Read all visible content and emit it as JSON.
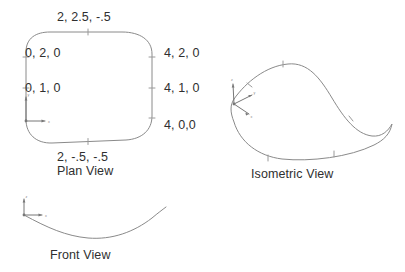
{
  "document": {
    "title": "Surface Patch Orthographic and Isometric Views",
    "background_color": "#ffffff",
    "line_color": "#8a8a8a",
    "text_color": "#2f2f2f"
  },
  "plan_view": {
    "title": "Plan View",
    "shape_name": "rounded-patch-outline",
    "labels": {
      "top": "2, 2.5, -.5",
      "left_upper": "0, 2, 0",
      "left_lower": "0, 1, 0",
      "right_upper": "4, 2, 0",
      "right_middle": "4, 1, 0",
      "right_lower": "4, 0,0",
      "bottom": "2, -.5, -.5"
    },
    "axis": {
      "x_label": "x",
      "y_label": "y"
    }
  },
  "isometric_view": {
    "title": "Isometric View",
    "shape_name": "saddle-patch-outline",
    "axis": {
      "x_label": "x",
      "y_label": "y",
      "z_label": "z"
    }
  },
  "front_view": {
    "title": "Front View",
    "shape_name": "sagging-curve",
    "axis": {
      "x_label": "x",
      "z_label": "z"
    }
  }
}
